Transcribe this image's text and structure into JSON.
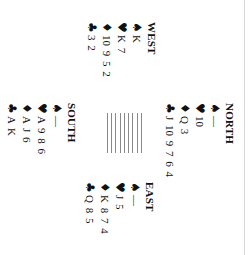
{
  "hands": {
    "north": {
      "label": "NORTH",
      "spades": "—",
      "hearts": "10",
      "diamonds": "Q 3",
      "clubs": "J 10 9 7 6 4"
    },
    "west": {
      "label": "WEST",
      "spades": "K",
      "hearts": "K 7",
      "diamonds": "10 9 5 2",
      "clubs": "3 2"
    },
    "east": {
      "label": "EAST",
      "spades": "—",
      "hearts": "J 5",
      "diamonds": "K 8 7 4",
      "clubs": "Q 8 5"
    },
    "south": {
      "label": "SOUTH",
      "spades": "—",
      "hearts": "A 9 8 6",
      "diamonds": "A J 6",
      "clubs": "A K"
    }
  },
  "suits": {
    "spades": "♠",
    "hearts": "♥",
    "diamonds": "♦",
    "clubs": "♣"
  },
  "colors": {
    "text": "#111111",
    "background": "#ffffff",
    "table_lines": "#8a8a8a"
  },
  "orientation": "rotated-90-clockwise"
}
